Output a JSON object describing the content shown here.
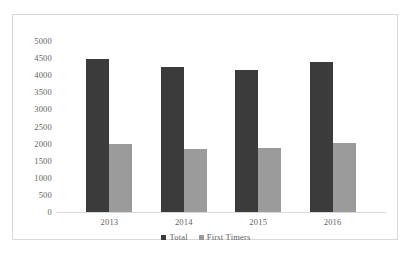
{
  "chart_data": {
    "type": "bar",
    "title": "",
    "xlabel": "",
    "ylabel": "",
    "categories": [
      "2013",
      "2014",
      "2015",
      "2016"
    ],
    "series": [
      {
        "name": "Total",
        "color": "#3b3b3b",
        "values": [
          4480,
          4230,
          4150,
          4400
        ]
      },
      {
        "name": "First Timers",
        "color": "#9b9b9b",
        "values": [
          2000,
          1850,
          1880,
          2030
        ]
      }
    ],
    "ylim": [
      0,
      5000
    ],
    "ytick_step": 500,
    "yticks": [
      "5000",
      "4500",
      "4000",
      "3500",
      "3000",
      "2500",
      "2000",
      "1500",
      "1000",
      "500",
      "0"
    ],
    "grid": false,
    "legend_position": "bottom",
    "legend": [
      "Total",
      "First Timers"
    ],
    "plot_border": "#d8d8d8",
    "axis_line_color": "#d9d9d9",
    "background": "#ffffff"
  }
}
